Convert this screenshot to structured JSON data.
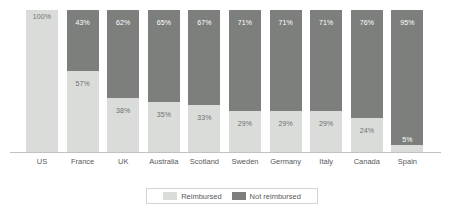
{
  "chart_data": {
    "type": "bar",
    "stacked": true,
    "title": "",
    "subtitle": "",
    "xlabel": "",
    "ylabel": "",
    "ylim": [
      0,
      100
    ],
    "grid": false,
    "legend_position": "bottom",
    "categories": [
      "US",
      "France",
      "UK",
      "Australia",
      "Scotland",
      "Sweden",
      "Germany",
      "Italy",
      "Canada",
      "Spain"
    ],
    "series": [
      {
        "name": "Reimbursed",
        "color": "#d9dcd8",
        "values": [
          100,
          57,
          38,
          35,
          33,
          29,
          29,
          29,
          24,
          5
        ],
        "labels": [
          "100%",
          "57%",
          "38%",
          "35%",
          "33%",
          "29%",
          "29%",
          "29%",
          "24%",
          "5%"
        ]
      },
      {
        "name": "Not reimbursed",
        "color": "#7d7f7d",
        "values": [
          0,
          43,
          62,
          65,
          67,
          71,
          71,
          71,
          76,
          95
        ],
        "labels": [
          "",
          "43%",
          "62%",
          "65%",
          "67%",
          "71%",
          "71%",
          "71%",
          "76%",
          "95%"
        ]
      }
    ]
  },
  "legend": {
    "items": [
      {
        "label": "Reimbursed",
        "swatch": "reimb"
      },
      {
        "label": "Not reimbursed",
        "swatch": "notreimb"
      }
    ]
  },
  "colors": {
    "reimbursed": "#d9dcd8",
    "not_reimbursed": "#7d7f7d",
    "axis": "#bfc1c3",
    "text": "#58595b",
    "label_on_dark": "#ffffff"
  }
}
